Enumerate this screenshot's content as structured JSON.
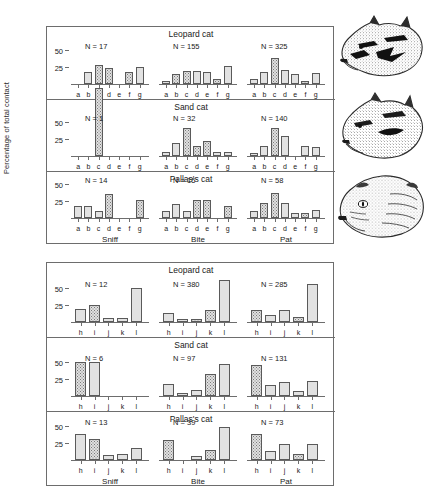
{
  "figure": {
    "ylabel": "Percentage of total contact",
    "behaviours": [
      "Sniff",
      "Bite",
      "Pat"
    ],
    "species": [
      "Leopard cat",
      "Sand cat",
      "Pallas's cat"
    ],
    "y_ticks": [
      25,
      50
    ],
    "y_tick_labels": [
      "25",
      "50"
    ],
    "categories_top": [
      "a",
      "b",
      "c",
      "d",
      "e",
      "f",
      "g"
    ],
    "categories_bottom": [
      "h",
      "i",
      "j",
      "k",
      "l"
    ],
    "n_prefix": "N = ",
    "colors": {
      "frame": "#6d6d6d",
      "bar_border": "#5a5a5a",
      "bar_plain": "#e2e2e2",
      "bar_stipple": "#e0e0e0",
      "text": "#1a1a1a",
      "background": "#ffffff"
    },
    "illustrations": [
      {
        "name": "leopard-cat-head",
        "caption": "Leopard cat head profile"
      },
      {
        "name": "sand-cat-head",
        "caption": "Sand cat head profile"
      },
      {
        "name": "pallas-cat-head",
        "caption": "Pallas's cat head profile"
      }
    ]
  },
  "chart_data": {
    "type": "bar",
    "xlabel": "",
    "ylabel": "Percentage of total contact",
    "ylim": [
      0,
      100
    ],
    "yticks": [
      25,
      50
    ],
    "grid": false,
    "legend": "none",
    "layout": "two stacked framed blocks; each block has 3 species rows (Leopard cat, Sand cat, Pallas's cat) x 3 behaviour panels (Sniff, Bite, Pat)",
    "panels": [
      {
        "block": "top",
        "species": "Leopard cat",
        "behaviour": "Sniff",
        "n_label": "N = 17",
        "n": 17,
        "categories": [
          "a",
          "b",
          "c",
          "d",
          "e",
          "f",
          "g"
        ],
        "values": [
          0,
          17,
          28,
          24,
          0,
          17,
          25
        ],
        "fills": [
          "plain",
          "plain",
          "stipple",
          "stipple",
          "plain",
          "stipple",
          "plain"
        ]
      },
      {
        "block": "top",
        "species": "Leopard cat",
        "behaviour": "Bite",
        "n_label": "N = 155",
        "n": 155,
        "categories": [
          "a",
          "b",
          "c",
          "d",
          "e",
          "f",
          "g"
        ],
        "values": [
          4,
          14,
          19,
          19,
          18,
          7,
          26
        ],
        "fills": [
          "plain",
          "stipple",
          "stipple",
          "plain",
          "plain",
          "stipple",
          "plain"
        ]
      },
      {
        "block": "top",
        "species": "Leopard cat",
        "behaviour": "Pat",
        "n_label": "N = 325",
        "n": 325,
        "categories": [
          "a",
          "b",
          "c",
          "d",
          "e",
          "f",
          "g"
        ],
        "values": [
          8,
          17,
          38,
          21,
          14,
          4,
          16
        ],
        "fills": [
          "plain",
          "plain",
          "stipple",
          "plain",
          "plain",
          "stipple",
          "plain"
        ]
      },
      {
        "block": "top",
        "species": "Sand cat",
        "behaviour": "Sniff",
        "n_label": "N = 1",
        "n": 1,
        "categories": [
          "a",
          "b",
          "c",
          "d",
          "e",
          "f",
          "g"
        ],
        "values": [
          0,
          0,
          100,
          0,
          0,
          0,
          0
        ],
        "fills": [
          "plain",
          "plain",
          "stipple",
          "plain",
          "plain",
          "plain",
          "plain"
        ]
      },
      {
        "block": "top",
        "species": "Sand cat",
        "behaviour": "Bite",
        "n_label": "N = 32",
        "n": 32,
        "categories": [
          "a",
          "b",
          "c",
          "d",
          "e",
          "f",
          "g"
        ],
        "values": [
          6,
          19,
          41,
          15,
          22,
          6,
          6
        ],
        "fills": [
          "plain",
          "plain",
          "stipple",
          "stipple",
          "stipple",
          "plain",
          "plain"
        ]
      },
      {
        "block": "top",
        "species": "Sand cat",
        "behaviour": "Pat",
        "n_label": "N = 140",
        "n": 140,
        "categories": [
          "a",
          "b",
          "c",
          "d",
          "e",
          "f",
          "g"
        ],
        "values": [
          5,
          14,
          41,
          30,
          0,
          14,
          13
        ],
        "fills": [
          "plain",
          "plain",
          "stipple",
          "plain",
          "plain",
          "plain",
          "plain"
        ]
      },
      {
        "block": "top",
        "species": "Pallas's cat",
        "behaviour": "Sniff",
        "n_label": "N = 14",
        "n": 14,
        "categories": [
          "a",
          "b",
          "c",
          "d",
          "e",
          "f",
          "g"
        ],
        "values": [
          18,
          18,
          10,
          36,
          0,
          0,
          27
        ],
        "fills": [
          "plain",
          "plain",
          "plain",
          "stipple",
          "plain",
          "plain",
          "stipple"
        ]
      },
      {
        "block": "top",
        "species": "Pallas's cat",
        "behaviour": "Bite",
        "n_label": "N = 15",
        "n": 15,
        "categories": [
          "a",
          "b",
          "c",
          "d",
          "e",
          "f",
          "g"
        ],
        "values": [
          11,
          21,
          11,
          27,
          27,
          0,
          17
        ],
        "fills": [
          "plain",
          "plain",
          "plain",
          "stipple",
          "stipple",
          "plain",
          "stipple"
        ]
      },
      {
        "block": "top",
        "species": "Pallas's cat",
        "behaviour": "Pat",
        "n_label": "N = 58",
        "n": 58,
        "categories": [
          "a",
          "b",
          "c",
          "d",
          "e",
          "f",
          "g"
        ],
        "values": [
          10,
          22,
          37,
          22,
          7,
          7,
          12
        ],
        "fills": [
          "plain",
          "stipple",
          "stipple",
          "plain",
          "plain",
          "stipple",
          "plain"
        ]
      },
      {
        "block": "bottom",
        "species": "Leopard cat",
        "behaviour": "Sniff",
        "n_label": "N = 12",
        "n": 12,
        "categories": [
          "h",
          "i",
          "j",
          "k",
          "l"
        ],
        "values": [
          19,
          25,
          6,
          6,
          50
        ],
        "fills": [
          "plain",
          "stipple",
          "plain",
          "plain",
          "plain"
        ]
      },
      {
        "block": "bottom",
        "species": "Leopard cat",
        "behaviour": "Bite",
        "n_label": "N = 380",
        "n": 380,
        "categories": [
          "h",
          "i",
          "j",
          "k",
          "l"
        ],
        "values": [
          13,
          4,
          5,
          17,
          62
        ],
        "fills": [
          "plain",
          "plain",
          "stipple",
          "stipple",
          "plain"
        ]
      },
      {
        "block": "bottom",
        "species": "Leopard cat",
        "behaviour": "Pat",
        "n_label": "N = 285",
        "n": 285,
        "categories": [
          "h",
          "i",
          "j",
          "k",
          "l"
        ],
        "values": [
          17,
          11,
          18,
          8,
          56
        ],
        "fills": [
          "stipple",
          "plain",
          "plain",
          "stipple",
          "plain"
        ]
      },
      {
        "block": "bottom",
        "species": "Sand cat",
        "behaviour": "Sniff",
        "n_label": "N = 6",
        "n": 6,
        "categories": [
          "h",
          "i",
          "j",
          "k",
          "l"
        ],
        "values": [
          50,
          50,
          0,
          0,
          0
        ],
        "fills": [
          "stipple",
          "plain",
          "plain",
          "plain",
          "plain"
        ]
      },
      {
        "block": "bottom",
        "species": "Sand cat",
        "behaviour": "Bite",
        "n_label": "N = 97",
        "n": 97,
        "categories": [
          "h",
          "i",
          "j",
          "k",
          "l"
        ],
        "values": [
          17,
          5,
          9,
          32,
          47
        ],
        "fills": [
          "plain",
          "plain",
          "plain",
          "stipple",
          "plain"
        ]
      },
      {
        "block": "bottom",
        "species": "Sand cat",
        "behaviour": "Pat",
        "n_label": "N = 131",
        "n": 131,
        "categories": [
          "h",
          "i",
          "j",
          "k",
          "l"
        ],
        "values": [
          45,
          16,
          20,
          8,
          22
        ],
        "fills": [
          "stipple",
          "plain",
          "plain",
          "plain",
          "plain"
        ]
      },
      {
        "block": "bottom",
        "species": "Pallas's cat",
        "behaviour": "Sniff",
        "n_label": "N = 13",
        "n": 13,
        "categories": [
          "h",
          "i",
          "j",
          "k",
          "l"
        ],
        "values": [
          38,
          31,
          8,
          9,
          17
        ],
        "fills": [
          "plain",
          "stipple",
          "plain",
          "plain",
          "plain"
        ]
      },
      {
        "block": "bottom",
        "species": "Pallas's cat",
        "behaviour": "Bite",
        "n_label": "N = 39",
        "n": 39,
        "categories": [
          "h",
          "i",
          "j",
          "k",
          "l"
        ],
        "values": [
          30,
          0,
          6,
          15,
          49
        ],
        "fills": [
          "stipple",
          "plain",
          "plain",
          "stipple",
          "plain"
        ]
      },
      {
        "block": "bottom",
        "species": "Pallas's cat",
        "behaviour": "Pat",
        "n_label": "N = 73",
        "n": 73,
        "categories": [
          "h",
          "i",
          "j",
          "k",
          "l"
        ],
        "values": [
          38,
          13,
          24,
          9,
          24
        ],
        "fills": [
          "stipple",
          "plain",
          "plain",
          "stipple",
          "plain"
        ]
      }
    ]
  }
}
